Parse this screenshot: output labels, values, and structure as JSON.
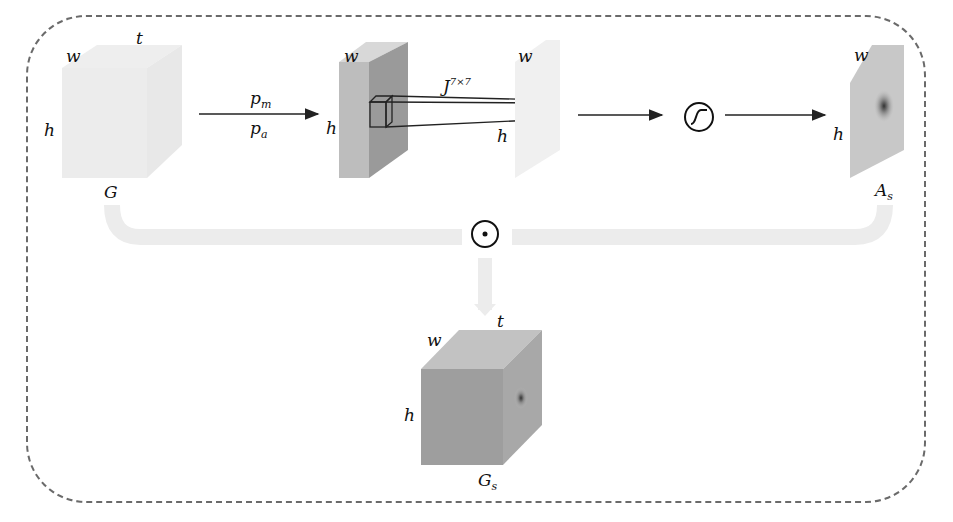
{
  "diagram": {
    "input": {
      "name": "G",
      "dims": {
        "w": "w",
        "h": "h",
        "t": "t"
      }
    },
    "pooling": {
      "top": "p",
      "top_sub": "m",
      "bottom": "p",
      "bottom_sub": "a"
    },
    "pooled_map": {
      "w": "w",
      "h": "h"
    },
    "conv": {
      "label": "J",
      "kernel": "7×7"
    },
    "conv_out": {
      "w": "w",
      "h": "h"
    },
    "activation": {
      "symbol": "sigmoid"
    },
    "attention": {
      "name": "A",
      "sub": "s",
      "w": "w",
      "h": "h"
    },
    "fusion": {
      "symbol": "⊙"
    },
    "output": {
      "name": "G",
      "sub": "s",
      "dims": {
        "w": "w",
        "h": "h",
        "t": "t"
      }
    }
  }
}
